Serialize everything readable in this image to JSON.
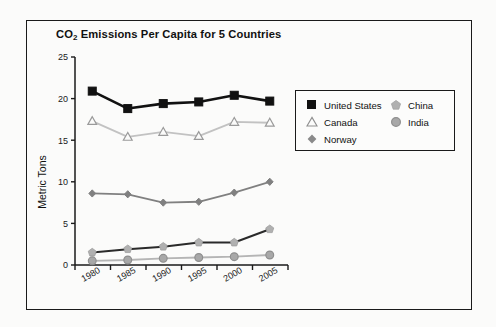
{
  "figure": {
    "background_color": "#fbfbfa",
    "frame_color": "#1a1a1a"
  },
  "title_prefix": "CO",
  "title_sub": "2",
  "title_suffix": " Emissions Per Capita for 5 Countries",
  "legend": {
    "left_column": [
      {
        "label": "United States",
        "marker": "filled-square-icon",
        "color": "#111111"
      },
      {
        "label": "Canada",
        "marker": "open-triangle-icon",
        "color": "#b8b8b8"
      },
      {
        "label": "Norway",
        "marker": "diamond-icon",
        "color": "#8a8a8a"
      }
    ],
    "right_column": [
      {
        "label": "China",
        "marker": "pentagon-icon",
        "color": "#b0b0b0"
      },
      {
        "label": "India",
        "marker": "circle-icon",
        "color": "#a8a8a8"
      }
    ]
  },
  "chart_data": {
    "type": "line",
    "title": "CO2 Emissions Per Capita for 5 Countries",
    "xlabel": "",
    "ylabel": "Metric Tons",
    "categories": [
      "1980",
      "1985",
      "1990",
      "1995",
      "2000",
      "2005"
    ],
    "ylim": [
      0,
      25
    ],
    "yticks": [
      0,
      5,
      10,
      15,
      20,
      25
    ],
    "grid": false,
    "legend_position": "right-inside",
    "series": [
      {
        "name": "United States",
        "marker": "filled-square",
        "line_color": "#111111",
        "marker_color": "#111111",
        "values": [
          20.9,
          18.8,
          19.4,
          19.6,
          20.4,
          19.7
        ]
      },
      {
        "name": "Canada",
        "marker": "open-triangle",
        "line_color": "#c2c2c2",
        "marker_color": "#ffffff",
        "values": [
          17.3,
          15.4,
          16.0,
          15.5,
          17.2,
          17.1
        ]
      },
      {
        "name": "Norway",
        "marker": "diamond",
        "line_color": "#808080",
        "marker_color": "#808080",
        "values": [
          8.6,
          8.5,
          7.5,
          7.6,
          8.7,
          10.0
        ]
      },
      {
        "name": "China",
        "marker": "pentagon",
        "line_color": "#2a2a2a",
        "marker_color": "#b0b0b0",
        "values": [
          1.5,
          1.9,
          2.2,
          2.7,
          2.7,
          4.3
        ]
      },
      {
        "name": "India",
        "marker": "circle",
        "line_color": "#b5b5b5",
        "marker_color": "#a8a8a8",
        "values": [
          0.5,
          0.6,
          0.8,
          0.9,
          1.0,
          1.2
        ]
      }
    ]
  }
}
